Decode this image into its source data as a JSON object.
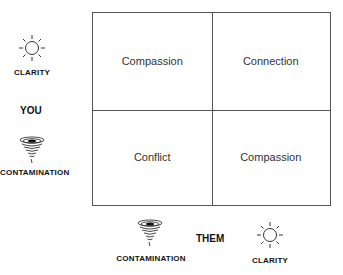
{
  "quadrants": {
    "top_left": "Compassion",
    "top_right": "Connection",
    "bottom_left": "Conflict",
    "bottom_right": "Compassion"
  },
  "y_axis": {
    "title": "YOU",
    "top_label": "CLARITY",
    "top_icon": "sun-icon",
    "bottom_label": "CONTAMINATION",
    "bottom_icon": "tornado-icon"
  },
  "x_axis": {
    "title": "THEM",
    "left_label": "CONTAMINATION",
    "left_icon": "tornado-icon",
    "right_label": "CLARITY",
    "right_icon": "sun-icon"
  },
  "colors": {
    "line": "#555555",
    "text": "#222222"
  }
}
